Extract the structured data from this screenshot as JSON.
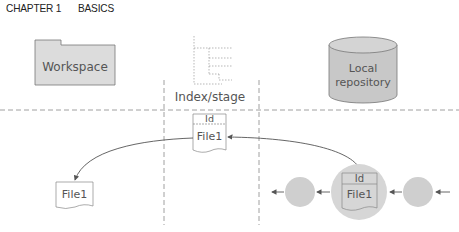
{
  "header": {
    "chapter": "CHAPTER 1",
    "title": "BASICS"
  },
  "areas": {
    "workspace": {
      "label": "Workspace",
      "icon": "folder-icon"
    },
    "index": {
      "label": "Index/stage",
      "icon": "tree-icon"
    },
    "repository": {
      "label_line1": "Local",
      "label_line2": "repository",
      "icon": "database-icon"
    }
  },
  "index_file": {
    "id": "Id",
    "name": "File1"
  },
  "workspace_file": {
    "name": "File1"
  },
  "commit_file": {
    "id": "Id",
    "name": "File1"
  },
  "colors": {
    "fill_light": "#dcdcdc",
    "fill_commit": "#c8c8c8",
    "stroke": "#666666",
    "dash": "#888888"
  }
}
